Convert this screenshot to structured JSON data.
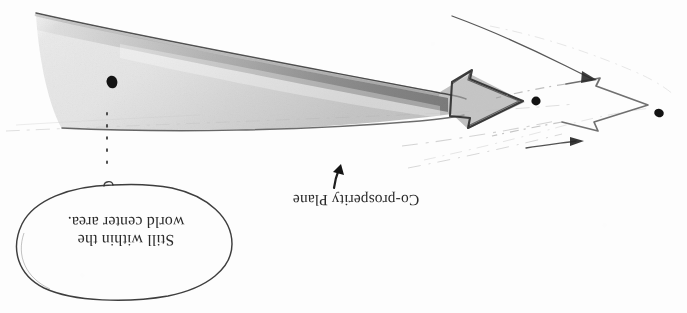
{
  "image": {
    "kind": "scanned-hand-drawn-diagram",
    "orientation": "upside-down",
    "width": 687,
    "height": 313,
    "background_color": "#fdfdfd",
    "ink_color": "#2b2b2b",
    "shading_color": "#b9b9b9"
  },
  "labels": {
    "callout_text": "Still within the\nworld center area.",
    "plane_label": "Co-prosperity Plane"
  },
  "annotations": {
    "callout_shape": "hand-drawn-ellipse",
    "pointer_arrow": "small-up-right-arrow",
    "dots": [
      {
        "name": "dot-left",
        "x": 112,
        "y": 82,
        "r": 5.5
      },
      {
        "name": "dot-middle",
        "x": 536,
        "y": 101,
        "r": 4.6
      },
      {
        "name": "dot-right",
        "x": 659,
        "y": 113,
        "r": 4.6
      }
    ],
    "dotted_vertical_line": {
      "x": 107,
      "y_start": 113,
      "y_end": 172
    },
    "big_shaded_arrow": "tapering-wedge-arrow-pointing-right",
    "hollow_arrow": "outlined-arrow-pointing-right",
    "thin_arrow_upper": "thin-line-arrow-down-right",
    "thin_arrow_lower": "short-line-arrow-right"
  }
}
